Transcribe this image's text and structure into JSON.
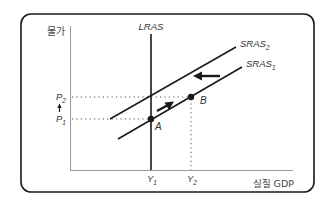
{
  "diagram": {
    "type": "AD-AS economics diagram",
    "y_axis_label": "물가",
    "x_axis_label": "실질 GDP",
    "curves": {
      "lras": {
        "name": "LRAS",
        "sub": ""
      },
      "sras1": {
        "name": "SRAS",
        "sub": "1"
      },
      "sras2": {
        "name": "SRAS",
        "sub": "2"
      }
    },
    "price_levels": [
      {
        "name": "P",
        "sub": "2"
      },
      {
        "name": "P",
        "sub": "1"
      }
    ],
    "output_levels": [
      {
        "name": "Y",
        "sub": "1"
      },
      {
        "name": "Y",
        "sub": "2"
      }
    ],
    "points": [
      {
        "label": "A",
        "x_level": "Y1",
        "price_level": "P1"
      },
      {
        "label": "B",
        "x_level": "Y2",
        "price_level": "P2"
      }
    ],
    "arrows": {
      "shift": "SRAS shifts left (from SRAS1 to SRAS2)",
      "movement": "Movement from A toward B along SRAS1",
      "price_indicator": "Price rises from P1 to P2"
    },
    "colors": {
      "line": "#1a1a1a",
      "axis": "#888888",
      "frame": "#1a1a1a",
      "dotted": "#555555"
    }
  }
}
